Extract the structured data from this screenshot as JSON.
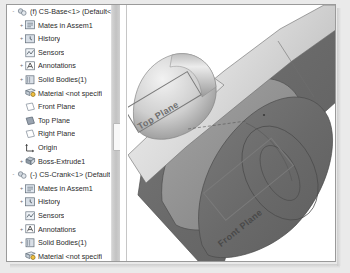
{
  "window": {
    "app": "SolidWorks FeatureManager",
    "background_color": "#e8e8e8",
    "panel_border_color": "#9a9a9a"
  },
  "tree": {
    "name": "feature-manager-design-tree",
    "rows": [
      {
        "depth": 0,
        "toggle": "-",
        "icon": "assembly-icon",
        "label": "(f) CS-Base<1> (Default<"
      },
      {
        "depth": 1,
        "toggle": "+",
        "icon": "mates-icon",
        "label": "Mates in Assem1"
      },
      {
        "depth": 1,
        "toggle": "+",
        "icon": "history-icon",
        "label": "History"
      },
      {
        "depth": 1,
        "toggle": "",
        "icon": "sensors-icon",
        "label": "Sensors"
      },
      {
        "depth": 1,
        "toggle": "+",
        "icon": "annotations-icon",
        "label": "Annotations"
      },
      {
        "depth": 1,
        "toggle": "+",
        "icon": "solid-bodies-icon",
        "label": "Solid Bodies(1)"
      },
      {
        "depth": 1,
        "toggle": "",
        "icon": "material-icon",
        "label": "Material <not specifi"
      },
      {
        "depth": 1,
        "toggle": "",
        "icon": "plane-icon",
        "label": "Front Plane"
      },
      {
        "depth": 1,
        "toggle": "",
        "icon": "plane-shaded-icon",
        "label": "Top Plane"
      },
      {
        "depth": 1,
        "toggle": "",
        "icon": "plane-icon",
        "label": "Right Plane"
      },
      {
        "depth": 1,
        "toggle": "",
        "icon": "origin-icon",
        "label": "Origin"
      },
      {
        "depth": 1,
        "toggle": "+",
        "icon": "boss-extrude-icon",
        "label": "Boss-Extrude1"
      },
      {
        "depth": 0,
        "toggle": "-",
        "icon": "assembly-icon",
        "label": "(-) CS-Crank<1> (Default"
      },
      {
        "depth": 1,
        "toggle": "+",
        "icon": "mates-icon",
        "label": "Mates in Assem1"
      },
      {
        "depth": 1,
        "toggle": "+",
        "icon": "history-icon",
        "label": "History"
      },
      {
        "depth": 1,
        "toggle": "",
        "icon": "sensors-icon",
        "label": "Sensors"
      },
      {
        "depth": 1,
        "toggle": "+",
        "icon": "annotations-icon",
        "label": "Annotations"
      },
      {
        "depth": 1,
        "toggle": "+",
        "icon": "solid-bodies-icon",
        "label": "Solid Bodies(1)"
      },
      {
        "depth": 1,
        "toggle": "",
        "icon": "material-icon",
        "label": "Material <not specifi"
      },
      {
        "depth": 1,
        "toggle": "",
        "icon": "plane-icon",
        "label": "Front Plane"
      },
      {
        "depth": 1,
        "toggle": "",
        "icon": "plane-shaded-icon",
        "label": "Top Plane"
      }
    ]
  },
  "scrollbar": {
    "name": "tree-vertical-scrollbar",
    "thumb_position_pct": 46
  },
  "viewport": {
    "name": "graphics-area",
    "background_color": "#ffffff",
    "annotations": [
      {
        "name": "top-plane-annotation",
        "label": "Top Plane",
        "rotation_deg": -31
      },
      {
        "name": "front-plane-annotation",
        "label": "Front Plane",
        "rotation_deg": -39
      }
    ],
    "model": {
      "name": "crank-assembly",
      "face_dark_color": "#6b6b6b",
      "face_mid_color": "#8f8f8f",
      "face_light_color": "#c9c9c9",
      "edge_color": "#4a4a4a"
    }
  }
}
